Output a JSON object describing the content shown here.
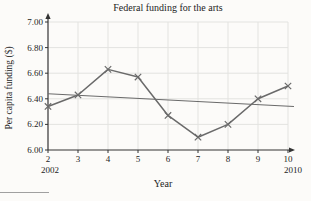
{
  "chart_data": {
    "type": "line",
    "title": "Federal funding for the arts",
    "xlabel": "Year",
    "ylabel": "Per capita funding ($)",
    "xlim": [
      2,
      10
    ],
    "ylim": [
      6.0,
      7.0
    ],
    "x_ticks": [
      2,
      3,
      4,
      5,
      6,
      7,
      8,
      9,
      10
    ],
    "y_ticks": [
      "6.00",
      "6.20",
      "6.40",
      "6.60",
      "6.80",
      "7.00"
    ],
    "x_sub_labels": [
      "2002",
      "2010"
    ],
    "grid": true,
    "x": [
      2,
      3,
      4,
      5,
      6,
      7,
      8,
      9,
      10
    ],
    "series": [
      {
        "name": "per-capita-funding",
        "label": "Per capita funding",
        "marker": "x",
        "values": [
          6.34,
          6.43,
          6.63,
          6.57,
          6.27,
          6.1,
          6.2,
          6.4,
          6.5
        ],
        "width": 1.5
      },
      {
        "name": "trend-line",
        "label": "Trend line",
        "marker": "none",
        "x": [
          2,
          10.2
        ],
        "values": [
          6.44,
          6.34
        ],
        "width": 1.1
      }
    ],
    "colors": {
      "series": "#6a6a6a",
      "grid": "#e3e3e0",
      "axis": "#333333",
      "text": "#1d1d1d",
      "background": "#fcfbf9",
      "footnote_rule": "#a0a0a0"
    }
  }
}
